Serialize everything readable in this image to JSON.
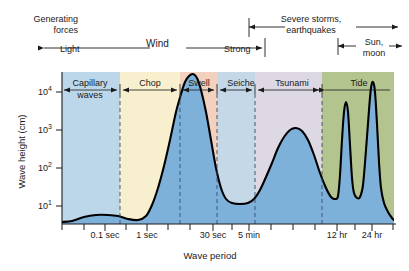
{
  "figure": {
    "top_band": {
      "generating_forces_label": "Generating\nforces",
      "generating_forces_line1": "Generating",
      "generating_forces_line2": "forces",
      "light_label": "Light",
      "wind_label": "Wind",
      "strong_label": "Strong",
      "severe_label_line1": "Severe storms,",
      "severe_label_line2": "earthquakes",
      "sunmoon_label_line1": "Sun,",
      "sunmoon_label_line2": "moon"
    }
  },
  "chart_data": {
    "type": "line",
    "title": "",
    "xlabel": "Wave period",
    "ylabel": "Wave height (cm)",
    "x_scale": "log",
    "y_scale": "log",
    "ylim": [
      3,
      20000
    ],
    "y_ticks": [
      {
        "value": 10,
        "label": "10",
        "exponent": "1"
      },
      {
        "value": 100,
        "label": "10",
        "exponent": "2"
      },
      {
        "value": 1000,
        "label": "10",
        "exponent": "3"
      },
      {
        "value": 10000,
        "label": "10",
        "exponent": "4"
      }
    ],
    "x_ticks": [
      {
        "label": "0.1 sec",
        "px": 105
      },
      {
        "label": "1 sec",
        "px": 147
      },
      {
        "label": "30 sec",
        "px": 213
      },
      {
        "label": "5 min",
        "px": 249
      },
      {
        "label": "12 hr",
        "px": 337
      },
      {
        "label": "24 hr",
        "px": 372
      }
    ],
    "x_minor_ticks_px": [
      62,
      84,
      126,
      168,
      190,
      232,
      271,
      293,
      315,
      355,
      393
    ],
    "grid": false,
    "legend": "none",
    "regions": [
      {
        "name": "Capillary waves",
        "label_line1": "Capillary",
        "label_line2": "waves",
        "color": "#bdd7ea",
        "x_start_px": 62,
        "x_end_px": 120
      },
      {
        "name": "Chop",
        "label_line1": "Chop",
        "label_line2": "",
        "color": "#f7efcd",
        "x_start_px": 120,
        "x_end_px": 180
      },
      {
        "name": "Swell",
        "label_line1": "Swell",
        "label_line2": "",
        "color": "#f2d2be",
        "x_start_px": 180,
        "x_end_px": 217
      },
      {
        "name": "Seiche",
        "label_line1": "Seiche",
        "label_line2": "",
        "color": "#c5d8e8",
        "x_start_px": 217,
        "x_end_px": 255
      },
      {
        "name": "Tsunami",
        "label_line1": "Tsunami",
        "label_line2": "",
        "color": "#ddd8e4",
        "x_start_px": 255,
        "x_end_px": 322
      },
      {
        "name": "Tide",
        "label_line1": "Tide",
        "label_line2": "",
        "color": "#b4c48e",
        "x_start_px": 322,
        "x_end_px": 394
      }
    ],
    "divider_px": [
      120,
      180,
      217,
      255,
      322
    ],
    "curve_fill_color": "#7eb1da",
    "curve_line_color": "#000000",
    "series": [
      {
        "name": "Wave energy / height envelope",
        "description": "Relative wave height across the wave-period spectrum, peaking at swell (~10 s), a secondary tsunami maximum (~15 min), and two sharp tide spikes at 12 hr and 24 hr.",
        "points_px": [
          [
            62,
            222
          ],
          [
            72,
            221
          ],
          [
            84,
            217
          ],
          [
            96,
            215
          ],
          [
            108,
            215
          ],
          [
            118,
            216
          ],
          [
            128,
            219
          ],
          [
            138,
            220
          ],
          [
            146,
            216
          ],
          [
            152,
            205
          ],
          [
            158,
            188
          ],
          [
            164,
            166
          ],
          [
            170,
            140
          ],
          [
            176,
            112
          ],
          [
            181,
            94
          ],
          [
            185,
            82
          ],
          [
            189,
            76
          ],
          [
            193,
            74
          ],
          [
            197,
            78
          ],
          [
            201,
            90
          ],
          [
            206,
            112
          ],
          [
            211,
            140
          ],
          [
            216,
            168
          ],
          [
            221,
            188
          ],
          [
            226,
            199
          ],
          [
            232,
            203
          ],
          [
            240,
            204
          ],
          [
            248,
            203
          ],
          [
            254,
            199
          ],
          [
            260,
            190
          ],
          [
            266,
            177
          ],
          [
            272,
            163
          ],
          [
            278,
            148
          ],
          [
            284,
            137
          ],
          [
            290,
            130
          ],
          [
            296,
            128
          ],
          [
            302,
            131
          ],
          [
            308,
            140
          ],
          [
            314,
            155
          ],
          [
            320,
            173
          ],
          [
            326,
            188
          ],
          [
            331,
            197
          ],
          [
            335,
            199
          ],
          [
            338,
            196
          ],
          [
            340,
            175
          ],
          [
            342,
            140
          ],
          [
            344,
            112
          ],
          [
            346,
            102
          ],
          [
            348,
            112
          ],
          [
            350,
            145
          ],
          [
            352,
            178
          ],
          [
            354,
            193
          ],
          [
            357,
            198
          ],
          [
            360,
            197
          ],
          [
            363,
            185
          ],
          [
            366,
            150
          ],
          [
            369,
            110
          ],
          [
            371,
            88
          ],
          [
            373,
            82
          ],
          [
            375,
            92
          ],
          [
            377,
            124
          ],
          [
            379,
            162
          ],
          [
            381,
            188
          ],
          [
            384,
            203
          ],
          [
            388,
            212
          ],
          [
            392,
            218
          ],
          [
            394,
            220
          ]
        ]
      }
    ]
  }
}
